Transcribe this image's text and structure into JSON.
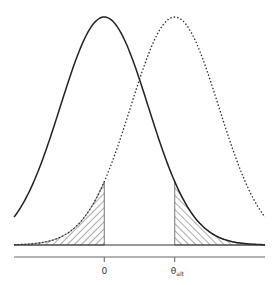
{
  "chart_data": {
    "type": "line",
    "title": "",
    "xlabel": "",
    "ylabel": "",
    "xlim": [
      -2.05,
      3.65
    ],
    "ylim": [
      0,
      1
    ],
    "grid": false,
    "legend": "none",
    "series": [
      {
        "name": "null-distribution",
        "mean": 0,
        "sd": 1,
        "style": "solid",
        "color": "#222222"
      },
      {
        "name": "alternative-distribution",
        "mean": 1.6,
        "sd": 1,
        "style": "dotted",
        "color": "#333333"
      }
    ],
    "shaded_regions": [
      {
        "name": "left-tail-under-alternative",
        "under": "alternative-distribution",
        "from": -2.05,
        "to": 0,
        "hatch": "backslash"
      },
      {
        "name": "right-tail-under-null",
        "under": "null-distribution",
        "from": 1.6,
        "to": 3.65,
        "hatch": "slash"
      }
    ],
    "x_ticks": [
      {
        "value": 0,
        "label": "0",
        "sub": ""
      },
      {
        "value": 1.6,
        "label": "θ",
        "sub": "alt"
      }
    ]
  }
}
